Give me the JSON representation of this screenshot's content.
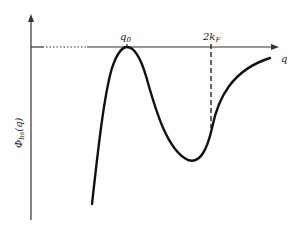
{
  "figure": {
    "type": "schematic curve",
    "y_axis_label": "Φ_bs(q)",
    "y_axis_label_main": "Φ",
    "y_axis_label_sub": "bs",
    "y_axis_label_arg": "(q)",
    "x_axis_label": "q",
    "markers": [
      {
        "label": "q0",
        "main": "q",
        "sub": "0",
        "description": "maximum touching the axis"
      },
      {
        "label": "2kF",
        "main": "2k",
        "sub": "F",
        "description": "dashed vertical line near the minimum"
      }
    ]
  }
}
